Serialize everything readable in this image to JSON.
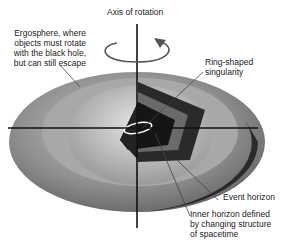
{
  "diagram": {
    "title": "Axis of rotation",
    "labels": {
      "ergosphere": "Ergosphere, where\nobjects must rotate\nwith the black hole,\nbut can still escape",
      "singularity": "Ring-shaped\nsingularity",
      "event_horizon": "Event horizon",
      "inner_horizon": "Inner horizon defined\nby changing structure\nof spacetime"
    },
    "colors": {
      "outer": "#8a8a8a",
      "dark": "#1a1a1a",
      "mid": "#b5b5b5",
      "ring": "#ffffff"
    }
  }
}
